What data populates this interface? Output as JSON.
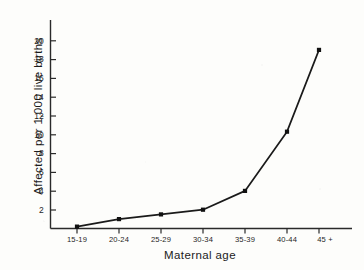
{
  "chart_data": {
    "type": "line",
    "title": "",
    "subtitle": "",
    "xlabel": "Maternal age",
    "ylabel": "Affected per 1,000 live births",
    "categories": [
      "15-19",
      "20-24",
      "25-29",
      "30-34",
      "35-39",
      "40-44",
      "45 +"
    ],
    "values": [
      0.2,
      1.0,
      1.5,
      2.0,
      4.0,
      10.3,
      19.0
    ],
    "series": [
      {
        "name": "Affected per 1,000 live births",
        "values": [
          0.2,
          1.0,
          1.5,
          2.0,
          4.0,
          10.3,
          19.0
        ]
      }
    ],
    "ylim": [
      0,
      21
    ],
    "xlim": [
      0,
      8
    ],
    "yticks": [
      2,
      4,
      6,
      8,
      10,
      12,
      14,
      16,
      18,
      20
    ],
    "ytick_labels": [
      "2",
      "4",
      "6",
      "8",
      "10",
      "12",
      "14",
      "16",
      "18",
      "20"
    ],
    "xtick_labels": [
      "15-19",
      "20-24",
      "25-29",
      "30-34",
      "35-39",
      "40-44",
      "45 +"
    ],
    "grid": false,
    "legend": false,
    "legend_position": "none",
    "marker": "square",
    "line_color": "#1a1a1a",
    "marker_color": "#111111",
    "axis_color": "#2a2a2a",
    "background_color": "#fdfdfb",
    "annotations": []
  },
  "axes": {
    "y_tick_values": [
      "20",
      "18",
      "16",
      "14",
      "12",
      "10",
      "8",
      "6",
      "4",
      "2"
    ],
    "x_tick_values": [
      "15-19",
      "20-24",
      "25-29",
      "30-34",
      "35-39",
      "40-44",
      "45 +"
    ]
  }
}
